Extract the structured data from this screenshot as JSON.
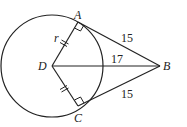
{
  "diagram": {
    "type": "geometry",
    "points": {
      "A": {
        "label": "A",
        "x": 78,
        "y": 22
      },
      "B": {
        "label": "B",
        "x": 160,
        "y": 66
      },
      "C": {
        "label": "C",
        "x": 78,
        "y": 106
      },
      "D": {
        "label": "D",
        "x": 52,
        "y": 66
      }
    },
    "circle": {
      "center": "D",
      "radius_px": 51
    },
    "segments": [
      {
        "from": "D",
        "to": "A",
        "label": "r"
      },
      {
        "from": "D",
        "to": "C",
        "label": ""
      },
      {
        "from": "A",
        "to": "B",
        "label": "15"
      },
      {
        "from": "D",
        "to": "B",
        "label": "17"
      },
      {
        "from": "C",
        "to": "B",
        "label": "15"
      }
    ],
    "right_angles": [
      "A",
      "C"
    ],
    "congruence_marks": [
      "DA",
      "DC"
    ]
  }
}
